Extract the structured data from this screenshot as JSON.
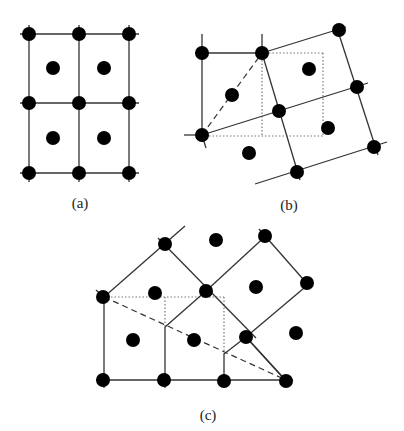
{
  "figure": {
    "width": 404,
    "height": 431,
    "colors": {
      "line": "#333333",
      "point": "#000000",
      "dotted": "#777777",
      "background": "#ffffff"
    },
    "point_radius": 7,
    "panels": [
      {
        "id": "a",
        "label": "(a)",
        "label_pos": [
          80,
          208
        ],
        "solid_lines": [
          [
            [
              20,
              34
            ],
            [
              139,
              34
            ]
          ],
          [
            [
              20,
              103
            ],
            [
              139,
              103
            ]
          ],
          [
            [
              20,
              173
            ],
            [
              139,
              173
            ]
          ],
          [
            [
              29,
              25
            ],
            [
              29,
              182
            ]
          ],
          [
            [
              79,
              25
            ],
            [
              79,
              182
            ]
          ],
          [
            [
              129,
              25
            ],
            [
              129,
              182
            ]
          ]
        ],
        "dashed_lines": [],
        "dotted_lines": [],
        "points": [
          [
            29,
            34
          ],
          [
            79,
            34
          ],
          [
            129,
            34
          ],
          [
            53,
            68
          ],
          [
            104,
            68
          ],
          [
            29,
            103
          ],
          [
            79,
            103
          ],
          [
            129,
            103
          ],
          [
            53,
            138
          ],
          [
            104,
            138
          ],
          [
            29,
            173
          ],
          [
            79,
            173
          ],
          [
            129,
            173
          ]
        ]
      },
      {
        "id": "b",
        "label": "(b)",
        "label_pos": [
          289,
          210
        ],
        "solid_lines": [
          [
            [
              195,
              53
            ],
            [
              262,
              53
            ]
          ],
          [
            [
              202,
              34
            ],
            [
              202,
              142
            ]
          ],
          [
            [
              262,
              34
            ],
            [
              262,
              53
            ]
          ],
          [
            [
              262,
              53
            ],
            [
              346,
              27
            ]
          ],
          [
            [
              202,
              135
            ],
            [
              368,
              83
            ]
          ],
          [
            [
              255,
              184
            ],
            [
              387,
              142
            ]
          ],
          [
            [
              262,
              53
            ],
            [
              300,
              180
            ]
          ],
          [
            [
              336,
              25
            ],
            [
              378,
              155
            ]
          ],
          [
            [
              184,
              135
            ],
            [
              202,
              135
            ]
          ],
          [
            [
              202,
              135
            ],
            [
              206,
              148
            ]
          ]
        ],
        "dashed_lines": [
          [
            [
              202,
              135
            ],
            [
              262,
              53
            ]
          ]
        ],
        "dotted_lines": [
          [
            [
              262,
              53
            ],
            [
              323,
              53
            ]
          ],
          [
            [
              323,
              53
            ],
            [
              323,
              136
            ]
          ],
          [
            [
              262,
              53
            ],
            [
              262,
              136
            ]
          ],
          [
            [
              202,
              136
            ],
            [
              323,
              136
            ]
          ]
        ],
        "points": [
          [
            202,
            53
          ],
          [
            262,
            53
          ],
          [
            339,
            30
          ],
          [
            232,
            95
          ],
          [
            309,
            69
          ],
          [
            202,
            135
          ],
          [
            279,
            111
          ],
          [
            357,
            87
          ],
          [
            328,
            128
          ],
          [
            249,
            153
          ],
          [
            297,
            172
          ],
          [
            374,
            147
          ]
        ]
      },
      {
        "id": "c",
        "label": "(c)",
        "label_pos": [
          208,
          420
        ],
        "solid_lines": [
          [
            [
              96,
              380
            ],
            [
              293,
              380
            ]
          ],
          [
            [
              104,
              297
            ],
            [
              104,
              388
            ]
          ],
          [
            [
              165,
              327
            ],
            [
              165,
              388
            ]
          ],
          [
            [
              224,
              354
            ],
            [
              224,
              388
            ]
          ],
          [
            [
              96,
              290
            ],
            [
              104,
              297
            ]
          ],
          [
            [
              104,
              297
            ],
            [
              185,
              226
            ]
          ],
          [
            [
              158,
              238
            ],
            [
              256,
              338
            ]
          ],
          [
            [
              165,
              327
            ],
            [
              206,
              291
            ]
          ],
          [
            [
              206,
              291
            ],
            [
              270,
              232
            ]
          ],
          [
            [
              259,
              229
            ],
            [
              310,
              287
            ]
          ],
          [
            [
              224,
              354
            ],
            [
              246,
              337
            ]
          ],
          [
            [
              246,
              337
            ],
            [
              310,
              283
            ]
          ],
          [
            [
              246,
              337
            ],
            [
              290,
              385
            ]
          ],
          [
            [
              286,
              381
            ],
            [
              246,
              337
            ]
          ]
        ],
        "dashed_lines": [
          [
            [
              104,
              297
            ],
            [
              286,
              380
            ]
          ]
        ],
        "dotted_lines": [
          [
            [
              104,
              297
            ],
            [
              224,
              297
            ]
          ],
          [
            [
              165,
              297
            ],
            [
              165,
              327
            ]
          ],
          [
            [
              224,
              297
            ],
            [
              224,
              354
            ]
          ]
        ],
        "points": [
          [
            165,
            244
          ],
          [
            216,
            240
          ],
          [
            265,
            236
          ],
          [
            103,
            297
          ],
          [
            155,
            293
          ],
          [
            206,
            291
          ],
          [
            256,
            287
          ],
          [
            307,
            283
          ],
          [
            133,
            340
          ],
          [
            194,
            340
          ],
          [
            246,
            337
          ],
          [
            296,
            333
          ],
          [
            103,
            380
          ],
          [
            164,
            380
          ],
          [
            224,
            381
          ],
          [
            286,
            381
          ]
        ]
      }
    ]
  }
}
